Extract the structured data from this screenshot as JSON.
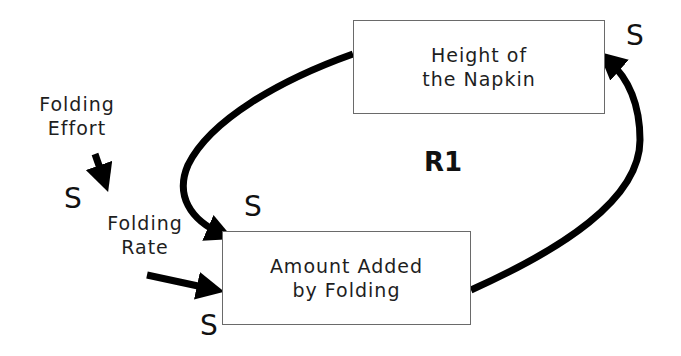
{
  "diagram": {
    "type": "causal-loop",
    "nodes": [
      {
        "id": "height",
        "label_line1": "Height of",
        "label_line2": "the Napkin"
      },
      {
        "id": "amount",
        "label_line1": "Amount Added",
        "label_line2": "by Folding"
      }
    ],
    "variables": {
      "folding_effort": {
        "line1": "Folding",
        "line2": "Effort"
      },
      "folding_rate": {
        "line1": "Folding",
        "line2": "Rate"
      }
    },
    "polarities": {
      "effort_to_rate": "S",
      "height_to_amount": "S",
      "amount_to_height": "S",
      "rate_to_amount": "S"
    },
    "loop_label": "R1",
    "links": [
      {
        "from": "Folding Effort",
        "to": "Folding Rate",
        "polarity": "S"
      },
      {
        "from": "Folding Rate",
        "to": "Amount Added by Folding",
        "polarity": "S"
      },
      {
        "from": "Height of the Napkin",
        "to": "Amount Added by Folding",
        "polarity": "S"
      },
      {
        "from": "Amount Added by Folding",
        "to": "Height of the Napkin",
        "polarity": "S"
      }
    ],
    "colors": {
      "arrow": "#000000",
      "box_border": "#6a6a6a",
      "text": "#1e1e1e",
      "background": "#ffffff"
    }
  }
}
